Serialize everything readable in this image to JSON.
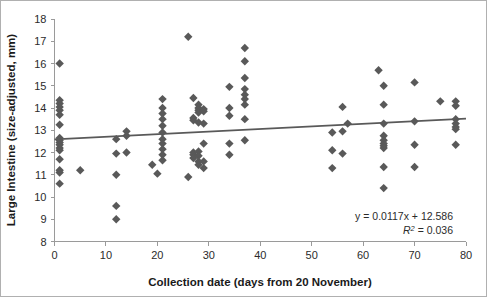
{
  "chart_data": {
    "type": "scatter",
    "title": "",
    "xlabel": "Collection date (days from 20 November)",
    "ylabel": "Large Intestine (size-adjusted, mm)",
    "xlim": [
      0,
      80
    ],
    "ylim": [
      8,
      18
    ],
    "xticks": [
      0,
      10,
      20,
      30,
      40,
      50,
      60,
      70,
      80
    ],
    "yticks": [
      8,
      9,
      10,
      11,
      12,
      13,
      14,
      15,
      16,
      17,
      18
    ],
    "grid": false,
    "legend": "none",
    "marker_shape": "diamond",
    "marker_color": "#595959",
    "trendline_color": "#595959",
    "annotations": {
      "equation": "y = 0.0117x + 12.586",
      "r_squared_prefix": "R",
      "r_squared_sup": "2",
      "r_squared_value": " = 0.036"
    },
    "trendline": {
      "slope": 0.0117,
      "intercept": 12.586,
      "r_squared": 0.036,
      "x_start": 0,
      "x_end": 80
    },
    "points": [
      [
        1,
        16.0
      ],
      [
        1,
        14.35
      ],
      [
        1,
        14.2
      ],
      [
        1,
        14.05
      ],
      [
        1,
        13.9
      ],
      [
        1,
        13.7
      ],
      [
        1,
        13.25
      ],
      [
        1,
        12.65
      ],
      [
        1,
        12.55
      ],
      [
        1,
        12.45
      ],
      [
        1,
        12.35
      ],
      [
        1,
        12.2
      ],
      [
        1,
        12.1
      ],
      [
        1,
        11.7
      ],
      [
        1,
        11.2
      ],
      [
        1,
        11.1
      ],
      [
        1,
        10.6
      ],
      [
        5,
        11.2
      ],
      [
        12,
        12.6
      ],
      [
        12,
        11.95
      ],
      [
        12,
        11.0
      ],
      [
        12,
        9.6
      ],
      [
        12,
        9.0
      ],
      [
        14,
        12.95
      ],
      [
        14,
        12.75
      ],
      [
        14,
        12.0
      ],
      [
        19,
        11.45
      ],
      [
        20,
        11.05
      ],
      [
        21,
        14.4
      ],
      [
        21,
        14.0
      ],
      [
        21,
        13.75
      ],
      [
        21,
        13.5
      ],
      [
        21,
        13.2
      ],
      [
        21,
        12.9
      ],
      [
        21,
        12.6
      ],
      [
        21,
        12.4
      ],
      [
        21,
        12.15
      ],
      [
        21,
        11.9
      ],
      [
        21,
        11.65
      ],
      [
        26,
        17.2
      ],
      [
        26,
        10.9
      ],
      [
        27,
        14.45
      ],
      [
        27,
        13.55
      ],
      [
        27,
        13.45
      ],
      [
        27,
        12.0
      ],
      [
        27,
        11.9
      ],
      [
        27,
        11.75
      ],
      [
        28,
        14.15
      ],
      [
        28,
        14.0
      ],
      [
        28,
        13.9
      ],
      [
        28,
        13.8
      ],
      [
        28,
        13.35
      ],
      [
        28,
        12.05
      ],
      [
        28,
        11.85
      ],
      [
        28,
        11.6
      ],
      [
        28,
        11.45
      ],
      [
        29,
        13.95
      ],
      [
        29,
        13.85
      ],
      [
        29,
        13.3
      ],
      [
        29,
        12.4
      ],
      [
        29,
        11.6
      ],
      [
        29,
        11.3
      ],
      [
        34,
        14.95
      ],
      [
        34,
        14.0
      ],
      [
        34,
        13.65
      ],
      [
        34,
        12.4
      ],
      [
        34,
        11.9
      ],
      [
        37,
        16.7
      ],
      [
        37,
        16.1
      ],
      [
        37,
        15.35
      ],
      [
        37,
        14.85
      ],
      [
        37,
        14.6
      ],
      [
        37,
        14.4
      ],
      [
        37,
        14.15
      ],
      [
        37,
        13.5
      ],
      [
        37,
        12.55
      ],
      [
        54,
        12.9
      ],
      [
        54,
        12.1
      ],
      [
        54,
        11.3
      ],
      [
        56,
        14.05
      ],
      [
        56,
        12.95
      ],
      [
        56,
        11.95
      ],
      [
        57,
        13.3
      ],
      [
        63,
        15.7
      ],
      [
        64,
        15.0
      ],
      [
        64,
        14.15
      ],
      [
        64,
        13.3
      ],
      [
        64,
        12.75
      ],
      [
        64,
        12.55
      ],
      [
        64,
        12.4
      ],
      [
        64,
        12.3
      ],
      [
        64,
        12.2
      ],
      [
        64,
        11.35
      ],
      [
        64,
        10.4
      ],
      [
        70,
        15.15
      ],
      [
        70,
        13.4
      ],
      [
        70,
        12.35
      ],
      [
        70,
        11.35
      ],
      [
        75,
        14.3
      ],
      [
        78,
        14.3
      ],
      [
        78,
        14.1
      ],
      [
        78,
        13.5
      ],
      [
        78,
        13.3
      ],
      [
        78,
        13.15
      ],
      [
        78,
        13.05
      ],
      [
        78,
        12.35
      ]
    ]
  },
  "axis": {
    "y_tick_labels": [
      "18",
      "17",
      "16",
      "15",
      "14",
      "13",
      "12",
      "11",
      "10",
      "9",
      "8"
    ],
    "x_tick_labels": [
      "0",
      "10",
      "20",
      "30",
      "40",
      "50",
      "60",
      "70",
      "80"
    ],
    "x_title": "Collection date (days from 20 November)",
    "y_title": "Large Intestine (size-adjusted, mm)"
  },
  "annotation": {
    "line1": "y = 0.0117x + 12.586",
    "line2_prefix": "R",
    "line2_sup": "2",
    "line2_rest": " = 0.036"
  }
}
